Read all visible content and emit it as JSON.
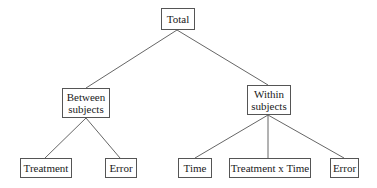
{
  "diagram": {
    "type": "tree",
    "root": {
      "label": "Total",
      "children": [
        {
          "label_line1": "Between",
          "label_line2": "subjects",
          "children": [
            {
              "label": "Treatment"
            },
            {
              "label": "Error"
            }
          ]
        },
        {
          "label_line1": "Within",
          "label_line2": "subjects",
          "children": [
            {
              "label": "Time"
            },
            {
              "label": "Treatment x Time"
            },
            {
              "label": "Error"
            }
          ]
        }
      ]
    },
    "line_color": "#666666",
    "border_color": "#555555"
  }
}
